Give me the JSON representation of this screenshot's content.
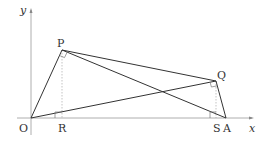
{
  "diagram": {
    "type": "coordinate-geometry",
    "axes": {
      "x_label": "x",
      "y_label": "y",
      "origin_label": "O"
    },
    "points": {
      "O": {
        "label": "O",
        "px": [
          31,
          118
        ]
      },
      "P": {
        "label": "P",
        "px": [
          62,
          50
        ]
      },
      "Q": {
        "label": "Q",
        "px": [
          216,
          81
        ]
      },
      "R": {
        "label": "R",
        "px": [
          62,
          118
        ]
      },
      "S": {
        "label": "S",
        "px": [
          216,
          118
        ]
      },
      "A": {
        "label": "A",
        "px": [
          226,
          118
        ]
      }
    },
    "segments": [
      "O-P",
      "P-Q",
      "P-A",
      "O-Q",
      "Q-A"
    ],
    "dotted_segments": [
      "P-R",
      "Q-S"
    ],
    "right_angles": [
      "P (angle OPA)",
      "Q (angle OQA)",
      "R (angle PRO)"
    ],
    "colors": {
      "line": "#333333",
      "axis": "#888888",
      "dotted": "#999999"
    }
  }
}
